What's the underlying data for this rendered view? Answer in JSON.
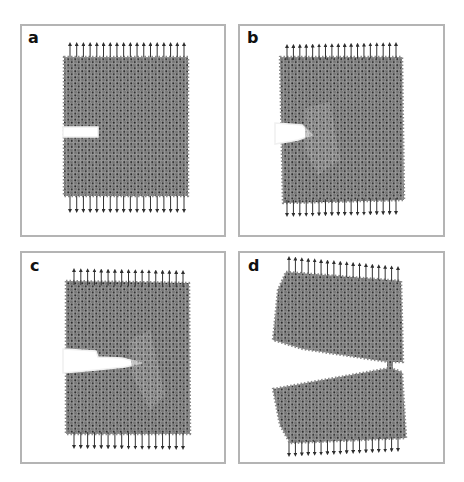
{
  "figure": {
    "colors": {
      "border": "#b4b4b4",
      "lattice_fill": "#7a7a7a",
      "lattice_node": "#2b2b2b",
      "arrow": "#3a3a3a",
      "background": "#ffffff"
    },
    "panels": [
      {
        "label": "a",
        "box": {
          "x": 20,
          "y": 24,
          "w": 206,
          "h": 213
        },
        "state": "initial notch",
        "lattice": [
          [
            64,
            57
          ],
          [
            188,
            57
          ],
          [
            188,
            196
          ],
          [
            64,
            196
          ]
        ],
        "cut": [
          [
            63,
            127
          ],
          [
            98,
            127
          ],
          [
            98,
            137
          ],
          [
            63,
            137
          ]
        ],
        "top_arrows": {
          "x0": 70,
          "x1": 184,
          "count": 18,
          "base_left": 57,
          "base_right": 57,
          "len": 13
        },
        "bottom_arrows": {
          "x0": 70,
          "x1": 184,
          "count": 18,
          "base_left": 196,
          "base_right": 196,
          "len": 15
        }
      },
      {
        "label": "b",
        "box": {
          "x": 238,
          "y": 24,
          "w": 207,
          "h": 213
        },
        "state": "crack blunting, damage zone",
        "lattice": [
          [
            280,
            57
          ],
          [
            402,
            57
          ],
          [
            404,
            200
          ],
          [
            283,
            203
          ]
        ],
        "cut": [
          [
            275,
            123
          ],
          [
            302,
            125
          ],
          [
            312,
            135
          ],
          [
            298,
            140
          ],
          [
            275,
            144
          ]
        ],
        "top_arrows": {
          "x0": 287,
          "x1": 396,
          "count": 18,
          "base_left": 60,
          "base_right": 58,
          "len": 14
        },
        "bottom_arrows": {
          "x0": 287,
          "x1": 396,
          "count": 18,
          "base_left": 200,
          "base_right": 198,
          "len": 15
        }
      },
      {
        "label": "c",
        "box": {
          "x": 20,
          "y": 251,
          "w": 206,
          "h": 213
        },
        "state": "crack propagation",
        "lattice": [
          [
            66,
            281
          ],
          [
            189,
            283
          ],
          [
            190,
            434
          ],
          [
            66,
            434
          ]
        ],
        "cut": [
          [
            63,
            349
          ],
          [
            96,
            351
          ],
          [
            98,
            357
          ],
          [
            122,
            358
          ],
          [
            142,
            363
          ],
          [
            125,
            367
          ],
          [
            96,
            370
          ],
          [
            63,
            373
          ]
        ],
        "top_arrows": {
          "x0": 74,
          "x1": 183,
          "count": 17,
          "base_left": 285,
          "base_right": 287,
          "len": 15
        },
        "bottom_arrows": {
          "x0": 74,
          "x1": 183,
          "count": 17,
          "base_left": 432,
          "base_right": 433,
          "len": 15
        }
      },
      {
        "label": "d",
        "box": {
          "x": 238,
          "y": 251,
          "w": 207,
          "h": 213
        },
        "state": "near-complete fracture, one bridging bond",
        "upper_block": [
          [
            286,
            272
          ],
          [
            401,
            281
          ],
          [
            403,
            362
          ],
          [
            389,
            362
          ],
          [
            303,
            349
          ],
          [
            273,
            340
          ],
          [
            278,
            290
          ]
        ],
        "lower_block": [
          [
            273,
            389
          ],
          [
            390,
            368
          ],
          [
            402,
            372
          ],
          [
            406,
            438
          ],
          [
            290,
            443
          ],
          [
            280,
            425
          ]
        ],
        "bridge": [
          [
            387,
            360
          ],
          [
            393,
            360
          ],
          [
            393,
            371
          ],
          [
            387,
            371
          ]
        ],
        "top_arrows": {
          "x0": 289,
          "x1": 398,
          "count": 18,
          "base_left": 272,
          "base_right": 282,
          "len": 14
        },
        "bottom_arrows": {
          "x0": 289,
          "x1": 398,
          "count": 18,
          "base_left": 442,
          "base_right": 437,
          "len": 13
        }
      }
    ]
  }
}
